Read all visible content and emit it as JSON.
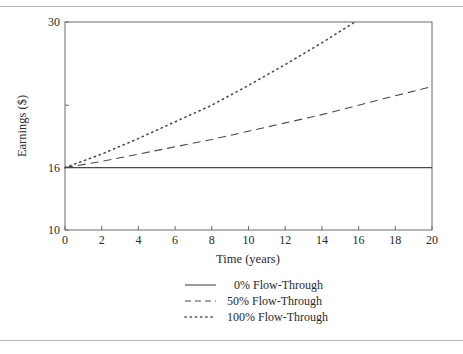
{
  "chart_data": {
    "type": "line",
    "title": "",
    "xlabel": "Time (years)",
    "ylabel": "Earnings ($)",
    "xlim": [
      0,
      20
    ],
    "ylim": [
      10,
      30
    ],
    "xticks": [
      0,
      2,
      4,
      6,
      8,
      10,
      12,
      14,
      16,
      18,
      20
    ],
    "yticks_labeled": [
      10,
      16,
      30
    ],
    "yticks_unlabeled": [
      22
    ],
    "grid": false,
    "legend_position": "bottom-center",
    "series": [
      {
        "name": "0% Flow-Through",
        "style": "solid",
        "x": [
          0,
          20
        ],
        "y": [
          16,
          16
        ]
      },
      {
        "name": "50% Flow-Through",
        "style": "dashed",
        "x": [
          0,
          2,
          4,
          6,
          8,
          10,
          12,
          14,
          16,
          18,
          20
        ],
        "y": [
          16.0,
          16.6,
          17.3,
          18.0,
          18.7,
          19.5,
          20.3,
          21.1,
          22.0,
          22.9,
          23.8
        ]
      },
      {
        "name": "100% Flow-Through",
        "style": "dotted",
        "x": [
          0,
          2,
          4,
          6,
          8,
          10,
          12,
          14,
          15.8
        ],
        "y": [
          16.0,
          17.3,
          18.8,
          20.4,
          22.0,
          23.9,
          25.9,
          28.0,
          30.0
        ]
      }
    ]
  }
}
